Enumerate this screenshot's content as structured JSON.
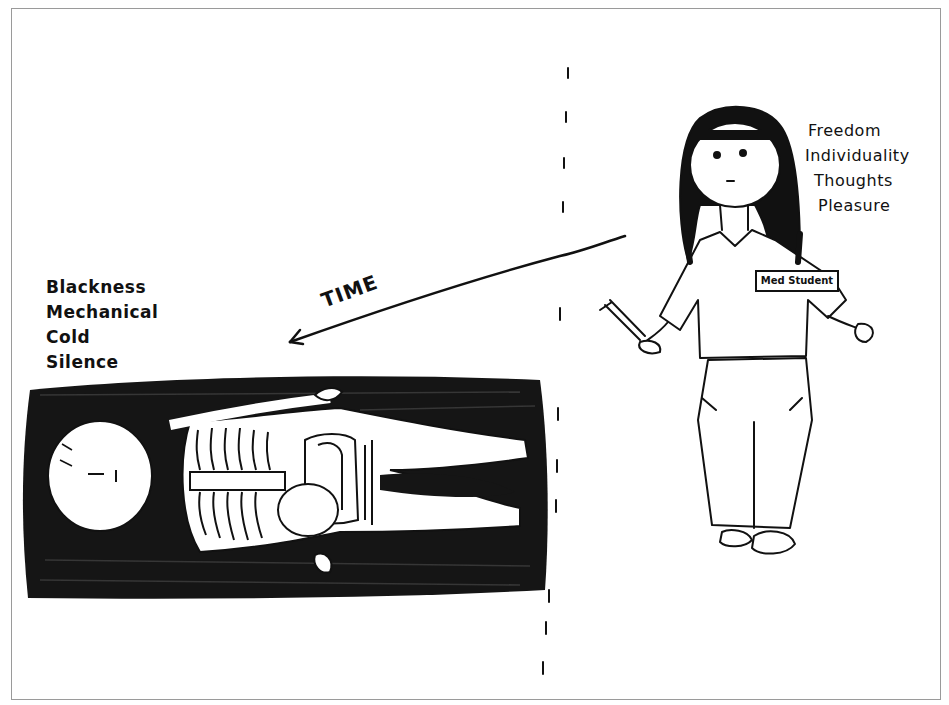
{
  "drawing": {
    "left_figure": {
      "description": "figure lying down on dark cross-hatched table",
      "words": [
        "Blackness",
        "Mechanical",
        "Cold",
        "Silence"
      ]
    },
    "right_figure": {
      "description": "standing student holding scalpel",
      "badge": "Med Student",
      "words": [
        "Freedom",
        "Individuality",
        "Thoughts",
        "Pleasure"
      ]
    },
    "arrow_label": "TIME",
    "colors": {
      "ink": "#111111",
      "paper": "#ffffff",
      "frame": "#9a9a9a"
    }
  }
}
